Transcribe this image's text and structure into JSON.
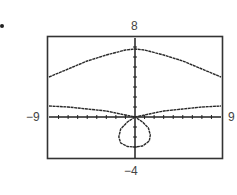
{
  "chart_data": {
    "type": "line",
    "title": "",
    "xlabel": "",
    "ylabel": "",
    "window": {
      "xmin": -9,
      "xmax": 9,
      "ymin": -4,
      "ymax": 8,
      "xscl": 1,
      "yscl": 1
    },
    "axis_labels": {
      "top": "8",
      "bottom": "−4",
      "left": "−9",
      "right": "9"
    },
    "grid": false,
    "legend": null,
    "series": [
      {
        "name": "upper branch",
        "x": [
          -9,
          -7,
          -5,
          -3,
          -1,
          0,
          1,
          3,
          5,
          7,
          9
        ],
        "y": [
          4.0,
          4.8,
          5.6,
          6.2,
          6.7,
          6.8,
          6.7,
          6.2,
          5.6,
          4.8,
          4.0
        ]
      },
      {
        "name": "lower branch",
        "x": [
          -9,
          -7,
          -5,
          -3,
          -1.5,
          -0.5,
          0,
          0.5,
          1.5,
          3,
          5,
          7,
          9
        ],
        "y": [
          1.1,
          1.0,
          0.8,
          0.6,
          0.3,
          0.1,
          0,
          0.1,
          0.3,
          0.6,
          0.8,
          1.0,
          1.1
        ]
      },
      {
        "name": "loop",
        "x": [
          0,
          -0.8,
          -1.5,
          -1.7,
          -1.5,
          -0.8,
          0,
          0.8,
          1.5,
          1.6,
          1.4,
          0.8,
          0
        ],
        "y": [
          0,
          -0.5,
          -1.2,
          -2.0,
          -2.6,
          -2.95,
          -3.0,
          -2.9,
          -2.4,
          -1.8,
          -1.1,
          -0.5,
          0
        ]
      }
    ]
  },
  "page": {
    "bullet": "•"
  },
  "colors": {
    "curve": "#2a2a2a",
    "frame": "#333333",
    "axis": "#222222"
  }
}
